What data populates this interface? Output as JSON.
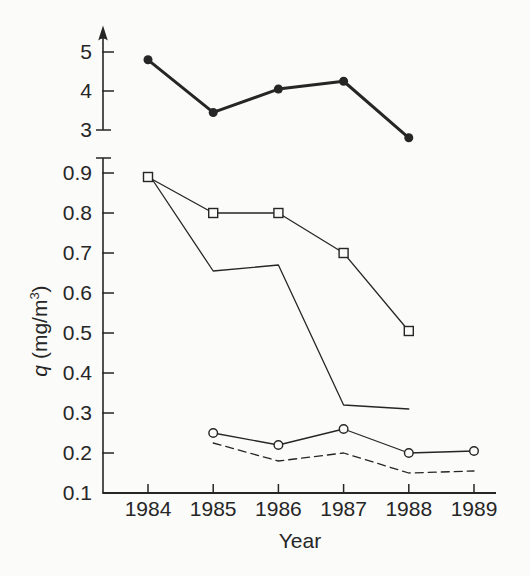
{
  "figure": {
    "background": "#fbfbf9",
    "ink": "#262626"
  },
  "chart_data": {
    "type": "line",
    "title": "",
    "xlabel": "Year",
    "ylabel": "q (mg/m³)",
    "ylabel_parts": {
      "symbol": "q",
      "unit_pre": " (mg/m",
      "unit_sup": "3",
      "unit_post": ")"
    },
    "x_categories": [
      1984,
      1985,
      1986,
      1987,
      1988,
      1989
    ],
    "x_tick_labels": [
      "1984",
      "1985",
      "1986",
      "1987",
      "1988",
      "1989"
    ],
    "grid": false,
    "legend": false,
    "axes": {
      "upper": {
        "arrowhead": true,
        "range": [
          3,
          5.4
        ],
        "ticks": [
          {
            "value": 5,
            "label": "5"
          },
          {
            "value": 4,
            "label": "4"
          },
          {
            "value": 3,
            "label": "3"
          }
        ]
      },
      "lower": {
        "end_cap": true,
        "range": [
          0.1,
          0.9375
        ],
        "ticks": [
          {
            "value": 0.9,
            "label": "0.9"
          },
          {
            "value": 0.8,
            "label": "0.8"
          },
          {
            "value": 0.7,
            "label": "0.7"
          },
          {
            "value": 0.6,
            "label": "0.6"
          },
          {
            "value": 0.5,
            "label": "0.5"
          },
          {
            "value": 0.4,
            "label": "0.4"
          },
          {
            "value": 0.3,
            "label": "0.3"
          },
          {
            "value": 0.2,
            "label": "0.2"
          },
          {
            "value": 0.1,
            "label": "0.1"
          }
        ]
      }
    },
    "series": [
      {
        "name": "bold-filled-circles",
        "axis": "upper",
        "marker": "filled-circle",
        "line": "solid-bold",
        "x": [
          1984,
          1985,
          1986,
          1987,
          1988
        ],
        "y": [
          4.8,
          3.45,
          4.05,
          4.25,
          2.8
        ]
      },
      {
        "name": "open-squares",
        "axis": "lower",
        "marker": "open-square",
        "line": "solid",
        "x": [
          1984,
          1985,
          1986,
          1987,
          1988
        ],
        "y": [
          0.89,
          0.8,
          0.8,
          0.7,
          0.505
        ]
      },
      {
        "name": "unmarked-solid",
        "axis": "lower",
        "marker": "none",
        "line": "solid",
        "x": [
          1984,
          1985,
          1986,
          1987,
          1988
        ],
        "y": [
          0.9,
          0.655,
          0.67,
          0.32,
          0.31
        ]
      },
      {
        "name": "open-circles",
        "axis": "lower",
        "marker": "open-circle",
        "line": "solid",
        "x": [
          1985,
          1986,
          1987,
          1988,
          1989
        ],
        "y": [
          0.25,
          0.22,
          0.26,
          0.2,
          0.205
        ]
      },
      {
        "name": "dashed-unmarked",
        "axis": "lower",
        "marker": "none",
        "line": "dashed",
        "x": [
          1985,
          1986,
          1987,
          1988,
          1989
        ],
        "y": [
          0.225,
          0.18,
          0.2,
          0.15,
          0.155
        ]
      }
    ]
  }
}
